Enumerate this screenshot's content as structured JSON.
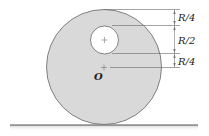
{
  "diagram": {
    "dim_labels": [
      "R/4",
      "R/2",
      "R/4"
    ],
    "center_label": "O",
    "colors": {
      "disk_fill": "#d9d9d9",
      "disk_stroke": "#666666",
      "hole_fill": "#ffffff",
      "ground": "#555555",
      "lines": "#555555"
    }
  }
}
